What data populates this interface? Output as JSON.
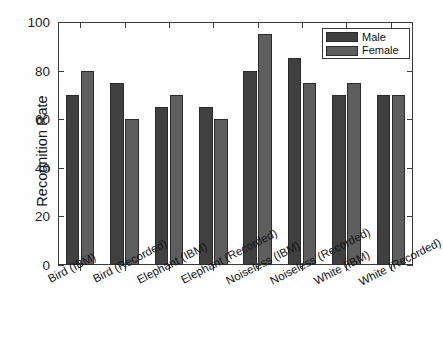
{
  "chart_data": {
    "type": "bar",
    "title": "",
    "xlabel": "",
    "ylabel": "Recognition Rate",
    "ylim": [
      0,
      100
    ],
    "yticks": [
      0,
      20,
      40,
      60,
      80,
      100
    ],
    "grid": false,
    "legend_position": "top-right",
    "categories": [
      "Bird (IBM)",
      "Bird (Recorded)",
      "Elephant (IBM)",
      "Elephant (Recorded)",
      "Noiseless (IBM)",
      "Noiseless (Recorded)",
      "White (IBM)",
      "White (Recorded)"
    ],
    "series": [
      {
        "name": "Male",
        "color": "#404040",
        "values": [
          70,
          75,
          65,
          65,
          80,
          85,
          70,
          70
        ]
      },
      {
        "name": "Female",
        "color": "#5e5e5e",
        "values": [
          80,
          60,
          70,
          60,
          95,
          75,
          75,
          70
        ]
      }
    ]
  },
  "axis": {
    "y_title": "Recognition Rate",
    "y_tick_labels": [
      "0",
      "20",
      "40",
      "60",
      "80",
      "100"
    ]
  },
  "legend": {
    "entries": [
      {
        "label": "Male"
      },
      {
        "label": "Female"
      }
    ]
  },
  "colors": {
    "male": "#404040",
    "female": "#5e5e5e",
    "axis": "#3a3a3a",
    "background": "#ffffff"
  }
}
